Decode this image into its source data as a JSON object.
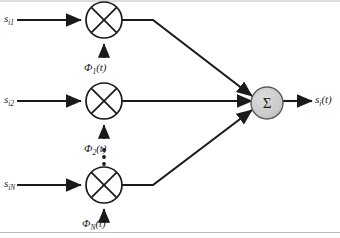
{
  "figure": {
    "kind": "block-diagram",
    "background_color": "#ffffff",
    "line_color": "#1a1a1a",
    "sum_node_fill": "#cccccc",
    "sum_node_stroke": "#555555",
    "border": {
      "top_rule": true,
      "bottom_rule": true,
      "color": "#bbbbbb"
    }
  },
  "branches": [
    {
      "input_label": "s",
      "input_sub": "i1",
      "carrier_symbol": "Φ",
      "carrier_sub": "1",
      "carrier_arg": "(t)",
      "mixer_glyph": "x-multiplier",
      "row_y": 20
    },
    {
      "input_label": "s",
      "input_sub": "i2",
      "carrier_symbol": "Φ",
      "carrier_sub": "2",
      "carrier_arg": "(t)",
      "mixer_glyph": "x-multiplier",
      "row_y": 101
    },
    {
      "input_label": "s",
      "input_sub": "iN",
      "carrier_symbol": "Φ",
      "carrier_sub": "N",
      "carrier_arg": "(t)",
      "mixer_glyph": "x-multiplier",
      "row_y": 185
    }
  ],
  "ellipsis": {
    "glyph": "vertical-dots",
    "count": 4
  },
  "sum_node": {
    "symbol": "Σ",
    "cx": 267,
    "cy": 103,
    "r": 16
  },
  "output": {
    "label": "s",
    "sub": "i",
    "arg": "(t)"
  }
}
